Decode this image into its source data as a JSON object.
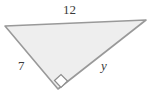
{
  "figure": {
    "kind": "right-triangle-diagram",
    "background_color": "#ffffff",
    "fill_color": "#eeeeee",
    "stroke_color": "#999999",
    "label_color": "#3a3a3a",
    "stroke_width": 1.6,
    "vertices": {
      "left": {
        "x": 5,
        "y": 26
      },
      "top_right": {
        "x": 146,
        "y": 20
      },
      "bottom": {
        "x": 58,
        "y": 89
      }
    },
    "polygon_points": "5,26 146,20 58,89",
    "right_angle": {
      "vertex": "bottom",
      "marker": "square",
      "center_x": 61,
      "center_y": 81,
      "size": 9,
      "marker_points": "54.5,80.5 61,74.5 67.5,81 61,87.5"
    },
    "labels": {
      "top_side": "12",
      "left_side": "7",
      "hypotenuse": "y"
    }
  }
}
